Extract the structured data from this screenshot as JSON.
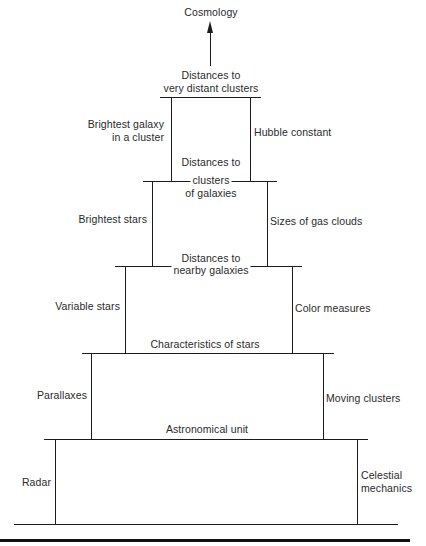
{
  "diagram": {
    "top": {
      "label": "Cosmology"
    },
    "tiers": [
      {
        "id": "tier-1",
        "top_label": "Distances to\nvery distant clusters",
        "left_method": "Brightest galaxy\nin a cluster",
        "right_method": "Hubble constant"
      },
      {
        "id": "tier-2",
        "top_label": "Distances to\nclusters\nof galaxies",
        "left_method": "Brightest stars",
        "right_method": "Sizes of gas clouds"
      },
      {
        "id": "tier-3",
        "top_label": "Distances to\nnearby galaxies",
        "left_method": "Variable stars",
        "right_method": "Color measures"
      },
      {
        "id": "tier-4",
        "top_label": "Characteristics of stars",
        "left_method": "Parallaxes",
        "right_method": "Moving clusters"
      },
      {
        "id": "tier-5",
        "top_label": "Astronomical unit",
        "left_method": "Radar",
        "right_method": "Celestial\nmechanics"
      }
    ],
    "labels": {
      "cosmology": "Cosmology",
      "t1_top_a": "Distances to",
      "t1_top_b": "very distant clusters",
      "t1_left_a": "Brightest galaxy",
      "t1_left_b": "in a cluster",
      "t1_right": "Hubble constant",
      "t2_top_a": "Distances to",
      "t2_top_b": "clusters",
      "t2_top_c": "of galaxies",
      "t2_left": "Brightest stars",
      "t2_right": "Sizes of gas clouds",
      "t3_top_a": "Distances to",
      "t3_top_b": "nearby galaxies",
      "t3_left": "Variable stars",
      "t3_right": "Color measures",
      "t4_top": "Characteristics of stars",
      "t4_left": "Parallaxes",
      "t4_right": "Moving clusters",
      "t5_top": "Astronomical unit",
      "t5_left": "Radar",
      "t5_right_a": "Celestial",
      "t5_right_b": "mechanics"
    },
    "colors": {
      "line": "#1c1c1c",
      "text": "#2a2a2a",
      "background": "#ffffff"
    }
  }
}
